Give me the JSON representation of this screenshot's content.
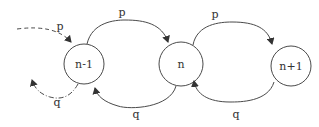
{
  "diagram": {
    "type": "state-transition",
    "colors": {
      "stroke": "#4a4a4a",
      "text": "#333333",
      "background": "#ffffff"
    },
    "nodes": [
      {
        "id": "n-1",
        "label": "n-1"
      },
      {
        "id": "n",
        "label": "n"
      },
      {
        "id": "n+1",
        "label": "n+1"
      }
    ],
    "edges": [
      {
        "from": "prev",
        "to": "n-1",
        "label": "p",
        "style": "dashed"
      },
      {
        "from": "n-1",
        "to": "prev",
        "label": "q",
        "style": "dash-dot"
      },
      {
        "from": "n-1",
        "to": "n",
        "label": "p",
        "style": "solid"
      },
      {
        "from": "n",
        "to": "n-1",
        "label": "q",
        "style": "solid"
      },
      {
        "from": "n",
        "to": "n+1",
        "label": "p",
        "style": "solid"
      },
      {
        "from": "n+1",
        "to": "n",
        "label": "q",
        "style": "solid"
      }
    ]
  }
}
